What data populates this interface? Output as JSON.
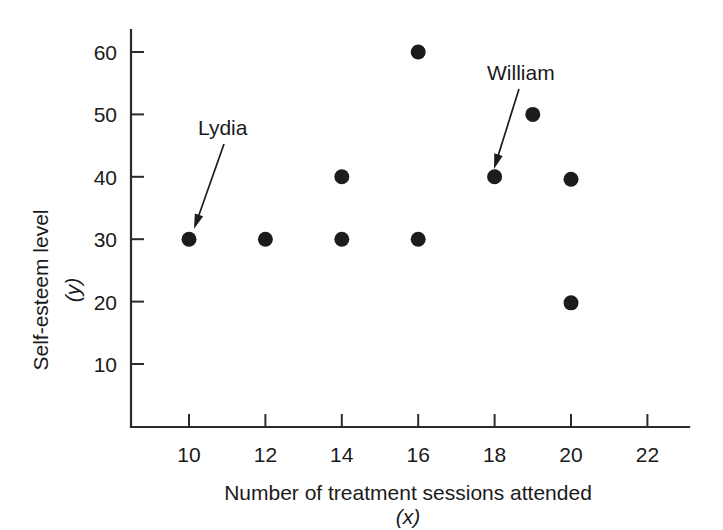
{
  "chart_data": {
    "type": "scatter",
    "title": "",
    "xlabel": "Number of treatment sessions attended",
    "xlabel_symbol": "(x)",
    "ylabel": "Self-esteem level",
    "ylabel_symbol": "(y)",
    "xlim": [
      8.6,
      23.4
    ],
    "ylim": [
      4,
      64
    ],
    "xticks": [
      10,
      12,
      14,
      16,
      18,
      20,
      22
    ],
    "xtick_labels": [
      "10",
      "12",
      "14",
      "16",
      "18",
      "20",
      "22"
    ],
    "yticks": [
      10,
      20,
      30,
      40,
      50,
      60
    ],
    "ytick_labels": [
      "10",
      "20",
      "30",
      "40",
      "50",
      "60"
    ],
    "grid": false,
    "legend": false,
    "marker": "filled-circle",
    "marker_color": "#1c1c1c",
    "points": [
      {
        "x": 10,
        "y": 30
      },
      {
        "x": 12,
        "y": 30
      },
      {
        "x": 14,
        "y": 30
      },
      {
        "x": 14,
        "y": 40
      },
      {
        "x": 16,
        "y": 30
      },
      {
        "x": 16,
        "y": 60
      },
      {
        "x": 18,
        "y": 40
      },
      {
        "x": 19,
        "y": 50
      },
      {
        "x": 20,
        "y": 39.6
      },
      {
        "x": 20,
        "y": 19.8
      }
    ],
    "annotations": [
      {
        "label": "Lydia",
        "target_x": 10,
        "target_y": 30,
        "text_x": 198,
        "text_y": 135,
        "arrow_from_x": 224,
        "arrow_from_y": 144,
        "arrow_to_x": 194,
        "arrow_to_y": 229
      },
      {
        "label": "William",
        "target_x": 18,
        "target_y": 40,
        "text_x": 487,
        "text_y": 80,
        "arrow_from_x": 519,
        "arrow_from_y": 89,
        "arrow_to_x": 494,
        "arrow_to_y": 169
      }
    ]
  },
  "colors": {
    "background": "#ffffff",
    "axis": "#2b2b2b",
    "marker": "#1c1c1c",
    "text": "#1a1a1a"
  }
}
